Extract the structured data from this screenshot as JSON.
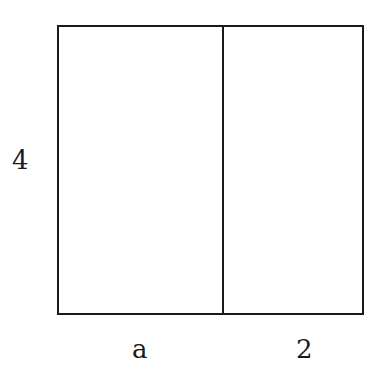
{
  "diagram": {
    "type": "area-model-rectangle",
    "labels": {
      "height": "4",
      "width_left": "a",
      "width_right": "2"
    },
    "colors": {
      "stroke": "#1a1a1a",
      "background": "#ffffff"
    }
  }
}
